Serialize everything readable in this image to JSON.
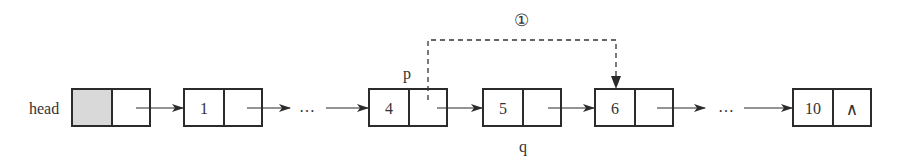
{
  "diagram": {
    "type": "singly-linked-list-deletion",
    "head_label": "head",
    "nodes": [
      {
        "id": "head",
        "data": "",
        "shaded": true,
        "next": "1"
      },
      {
        "id": "n1",
        "data": "1",
        "next": "…"
      },
      {
        "id": "n4",
        "data": "4",
        "next": "5"
      },
      {
        "id": "n5",
        "data": "5",
        "next": "6"
      },
      {
        "id": "n6",
        "data": "6",
        "next": "…"
      },
      {
        "id": "n10",
        "data": "10",
        "next": "∧"
      }
    ],
    "ellipsis": [
      "…",
      "…"
    ],
    "null_symbol": "∧",
    "pointer_labels": {
      "p": "p",
      "q": "q"
    },
    "step_label": "①",
    "step_description": "p->next = q->next (dashed arrow from node 4's next field to node 6)",
    "colors": {
      "stroke": "#2b2b2b",
      "head_fill": "#d9d9d9",
      "background": "#ffffff"
    }
  }
}
